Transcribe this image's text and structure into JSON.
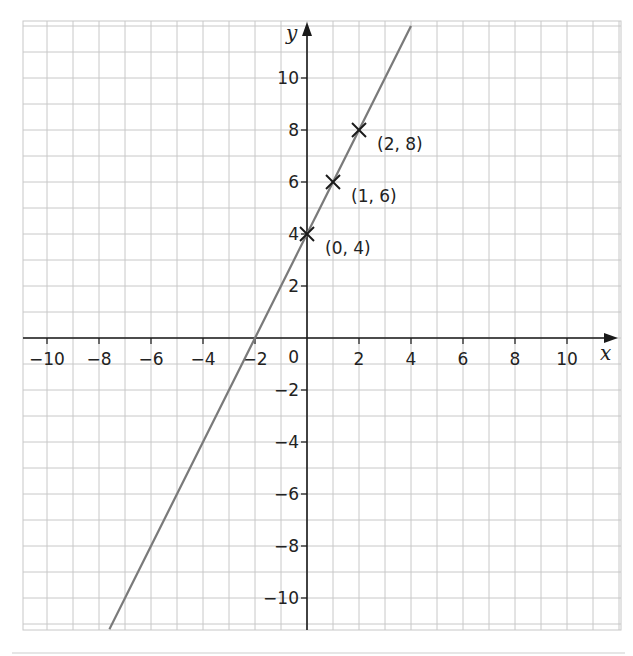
{
  "chart_data": {
    "type": "line",
    "title": "",
    "xlabel": "x",
    "ylabel": "y",
    "xlim": [
      -11,
      12
    ],
    "ylim": [
      -11.2,
      12
    ],
    "grid": true,
    "x_ticks": [
      -10,
      -8,
      -6,
      -4,
      -2,
      2,
      4,
      6,
      8,
      10
    ],
    "y_ticks": [
      -10,
      -8,
      -6,
      -4,
      -2,
      2,
      4,
      6,
      8,
      10
    ],
    "x_tick_labels": [
      "−10",
      "−8",
      "−6",
      "−4",
      "−2",
      "2",
      "4",
      "6",
      "8",
      "10"
    ],
    "y_tick_labels": [
      "−10",
      "−8",
      "−6",
      "−4",
      "−2",
      "2",
      "4",
      "6",
      "8",
      "10"
    ],
    "origin_label": "0",
    "series": [
      {
        "name": "y = 2x + 4",
        "slope": 2,
        "intercept": 4,
        "x": [
          -7.6,
          4
        ],
        "y": [
          -11.2,
          12
        ],
        "color": "#7a7a7a"
      }
    ],
    "points": [
      {
        "x": 0,
        "y": 4,
        "label": "(0, 4)",
        "marker": "x"
      },
      {
        "x": 1,
        "y": 6,
        "label": "(1, 6)",
        "marker": "x"
      },
      {
        "x": 2,
        "y": 8,
        "label": "(2, 8)",
        "marker": "x"
      }
    ]
  },
  "style": {
    "grid_color": "#c8c8c8",
    "axis_color": "#1a1a1a",
    "line_color": "#7a7a7a",
    "marker_color": "#1a1a1a"
  }
}
